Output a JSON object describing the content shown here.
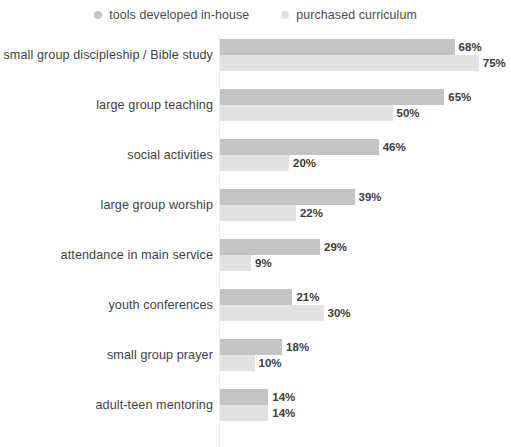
{
  "legend": {
    "position": "top-center",
    "entries": [
      {
        "label": "tools developed in-house",
        "color": "#c4c4c4",
        "icon": "legend-dot-icon"
      },
      {
        "label": "purchased curriculum",
        "color": "#e2e2e2",
        "icon": "legend-dot-icon"
      }
    ]
  },
  "chart_data": {
    "type": "bar",
    "orientation": "horizontal",
    "title": "",
    "subtitle": "",
    "xlabel": "",
    "ylabel": "",
    "xlim": [
      0,
      80
    ],
    "grid": false,
    "legend_position": "top-center",
    "value_suffix": "%",
    "categories": [
      "small group discipleship / Bible study",
      "large group teaching",
      "social activities",
      "large group worship",
      "attendance in main service",
      "youth conferences",
      "small group prayer",
      "adult-teen mentoring"
    ],
    "series": [
      {
        "name": "tools developed in-house",
        "color": "#c4c4c4",
        "values": [
          68,
          65,
          46,
          39,
          29,
          21,
          18,
          14
        ],
        "labels": [
          "68%",
          "65%",
          "46%",
          "39%",
          "29%",
          "21%",
          "18%",
          "14%"
        ]
      },
      {
        "name": "purchased curriculum",
        "color": "#e2e2e2",
        "values": [
          75,
          50,
          20,
          22,
          9,
          30,
          10,
          14
        ],
        "labels": [
          "75%",
          "50%",
          "20%",
          "22%",
          "9%",
          "30%",
          "10%",
          "14%"
        ]
      }
    ]
  },
  "style": {
    "background": "#ffffff",
    "axis_color": "#ededed",
    "label_color": "#3f3f3f",
    "value_color": "#3c3c3c",
    "px_per_unit": 3.45
  }
}
